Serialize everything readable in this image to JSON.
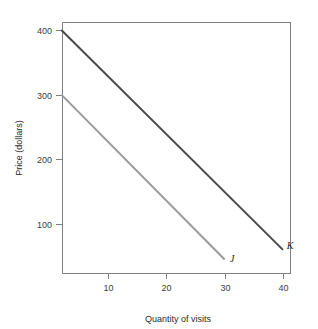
{
  "chart_data": {
    "type": "line",
    "title": "",
    "subtitle": "",
    "xlabel": "Quantity of visits",
    "ylabel": "Price (dollars)",
    "xlim": [
      0,
      42
    ],
    "ylim": [
      0,
      430
    ],
    "xticks": [
      10,
      20,
      30,
      40
    ],
    "xticklabels": [
      "10",
      "20",
      "30",
      "40"
    ],
    "yticks": [
      100,
      200,
      300,
      400
    ],
    "yticklabels": [
      "100",
      "200",
      "300",
      "400"
    ],
    "grid": false,
    "legend_position": "inline-endpoint-labels",
    "series": [
      {
        "name": "K",
        "label": "K",
        "color": "#4a4a4a",
        "linewidth": 2,
        "x": [
          2,
          40
        ],
        "y": [
          400,
          60
        ],
        "label_x": 41.2,
        "label_y": 62,
        "annotation": "K"
      },
      {
        "name": "J",
        "label": "J",
        "color": "#9a9a9a",
        "linewidth": 2,
        "x": [
          2,
          30
        ],
        "y": [
          300,
          45
        ],
        "label_x": 31.3,
        "label_y": 42,
        "annotation": "J"
      }
    ],
    "annotations": [
      {
        "text": "J",
        "x": 31.3,
        "y": 42
      },
      {
        "text": "K",
        "x": 41.2,
        "y": 62
      }
    ]
  },
  "axes": {
    "frame_color": "#808080",
    "tick_color": "#808080",
    "label_color": "#3c3c3c"
  },
  "figure": {
    "background": "#ffffff"
  }
}
